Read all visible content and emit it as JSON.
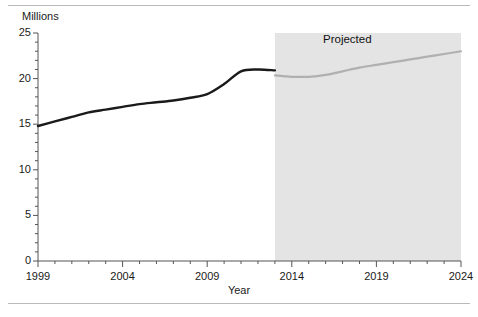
{
  "figure": {
    "has_top_rule": true,
    "has_bottom_rule": true
  },
  "chart_data": {
    "type": "line",
    "title": "",
    "subtitle": "",
    "xlabel": "Year",
    "ylabel": "Millions",
    "ylabel_position": "top-left",
    "xlim": [
      1999,
      2024
    ],
    "ylim": [
      0,
      25
    ],
    "grid": false,
    "legend": "none",
    "y_ticks": [
      "0",
      "5",
      "10",
      "15",
      "20",
      "25"
    ],
    "y_tick_values": [
      0,
      5,
      10,
      15,
      20,
      25
    ],
    "x_ticks": [
      "1999",
      "2004",
      "2009",
      "2014",
      "2019",
      "2024"
    ],
    "x_tick_values": [
      1999,
      2004,
      2009,
      2014,
      2019,
      2024
    ],
    "x_minor_tick_interval": 1,
    "annotations": [
      {
        "text": "Projected",
        "x": 2017,
        "y": 24
      }
    ],
    "shaded_regions": [
      {
        "label": "Projected",
        "x_start": 2013,
        "x_end": 2024,
        "color": "#e4e4e4"
      }
    ],
    "series": [
      {
        "name": "Actual",
        "color": "#1a1a1a",
        "line_width": 2.4,
        "x": [
          1999,
          2000,
          2001,
          2002,
          2003,
          2004,
          2005,
          2006,
          2007,
          2008,
          2009,
          2010,
          2011,
          2012,
          2013
        ],
        "values": [
          14.8,
          15.3,
          15.8,
          16.3,
          16.6,
          16.9,
          17.2,
          17.4,
          17.6,
          17.9,
          18.3,
          19.4,
          20.8,
          21.0,
          20.9
        ]
      },
      {
        "name": "Projected",
        "color": "#b0b0b0",
        "line_width": 2.2,
        "x": [
          2013,
          2014,
          2015,
          2016,
          2017,
          2018,
          2019,
          2020,
          2021,
          2022,
          2023,
          2024
        ],
        "values": [
          20.35,
          20.2,
          20.2,
          20.4,
          20.8,
          21.2,
          21.5,
          21.8,
          22.1,
          22.4,
          22.7,
          23.0
        ]
      }
    ],
    "actual_segment_end_year": 2013,
    "colors": {
      "actual_line": "#1a1a1a",
      "projected_line": "#b0b0b0",
      "projected_band": "#e4e4e4",
      "axis": "#555555",
      "text": "#1a1a1a"
    }
  }
}
